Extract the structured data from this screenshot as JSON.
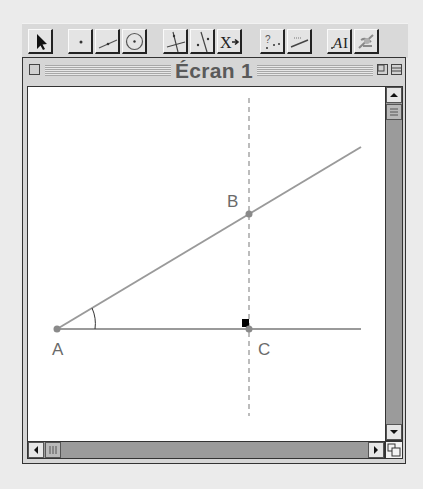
{
  "toolbar": {
    "tools": [
      {
        "name": "pointer-tool",
        "icon": "arrow-pointer-icon"
      },
      {
        "name": "point-tool",
        "icon": "point-icon"
      },
      {
        "name": "segment-tool",
        "icon": "segment-icon"
      },
      {
        "name": "circle-tool",
        "icon": "circle-icon"
      },
      {
        "name": "perpendicular-line-tool",
        "icon": "perpendicular-icon"
      },
      {
        "name": "parallel-line-tool",
        "icon": "parallel-icon"
      },
      {
        "name": "transformation-tool",
        "icon": "transform-icon",
        "label": "X→"
      },
      {
        "name": "properties-tool",
        "icon": "check-property-icon",
        "label": "?"
      },
      {
        "name": "measure-tool",
        "icon": "measure-icon"
      },
      {
        "name": "text-tool",
        "icon": "text-label-icon",
        "label": "AI"
      },
      {
        "name": "display-tool",
        "icon": "display-attributes-icon"
      }
    ]
  },
  "window": {
    "title": "Écran 1"
  },
  "figure": {
    "points": [
      {
        "label": "A",
        "x": 57,
        "y": 329
      },
      {
        "label": "B",
        "x": 249,
        "y": 214
      },
      {
        "label": "C",
        "x": 249,
        "y": 329
      }
    ],
    "colors": {
      "line": "#9a9a9a",
      "point": "#8a8a8a",
      "dashed": "#a0a0a0",
      "label": "#6a6a6a",
      "right_angle_marker": "#000000"
    }
  }
}
